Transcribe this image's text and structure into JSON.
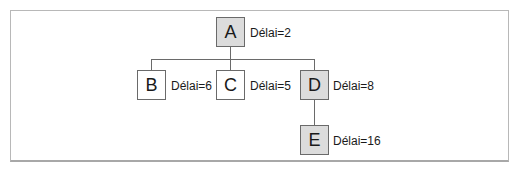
{
  "diagram": {
    "type": "tree",
    "nodes": [
      {
        "id": "A",
        "label": "A",
        "delay_label": "Délai=2",
        "shaded": true
      },
      {
        "id": "B",
        "label": "B",
        "delay_label": "Délai=6",
        "shaded": false
      },
      {
        "id": "C",
        "label": "C",
        "delay_label": "Délai=5",
        "shaded": false
      },
      {
        "id": "D",
        "label": "D",
        "delay_label": "Délai=8",
        "shaded": true
      },
      {
        "id": "E",
        "label": "E",
        "delay_label": "Délai=16",
        "shaded": true
      }
    ],
    "edges": [
      [
        "A",
        "B"
      ],
      [
        "A",
        "C"
      ],
      [
        "A",
        "D"
      ],
      [
        "D",
        "E"
      ]
    ],
    "colors": {
      "shaded_fill": "#dcdcdc",
      "plain_fill": "#ffffff",
      "stroke": "#6a6a6a"
    }
  }
}
